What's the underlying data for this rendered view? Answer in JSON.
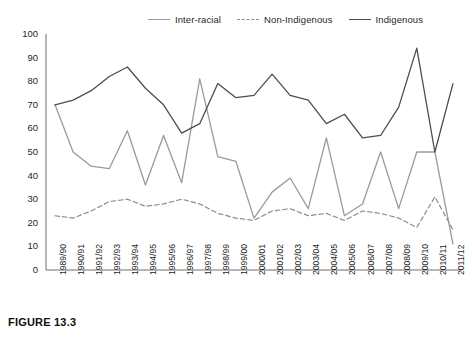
{
  "caption": "FIGURE 13.3",
  "legend": {
    "position": "top",
    "entries": [
      {
        "label": "Inter-racial",
        "color": "#9a9a9a",
        "style": "solid"
      },
      {
        "label": "Non-Indigenous",
        "color": "#8d8d8d",
        "style": "dashed"
      },
      {
        "label": "Indigenous",
        "color": "#4d4d4d",
        "style": "solid"
      }
    ]
  },
  "chart_data": {
    "type": "line",
    "title": "",
    "xlabel": "",
    "ylabel": "",
    "ylim": [
      0,
      100
    ],
    "yticks": [
      0,
      10,
      20,
      30,
      40,
      50,
      60,
      70,
      80,
      90,
      100
    ],
    "grid": false,
    "legend_position": "top",
    "categories": [
      "1989/90",
      "1990/91",
      "1991/92",
      "1992/93",
      "1993/94",
      "1994/95",
      "1995/96",
      "1996/97",
      "1997/98",
      "1998/99",
      "1999/00",
      "2000/01",
      "2001/02",
      "2002/03",
      "2003/04",
      "2004/05",
      "2005/06",
      "2006/07",
      "2007/08",
      "2008/09",
      "2009/10",
      "2010/11",
      "2011/12"
    ],
    "series": [
      {
        "name": "Inter-racial",
        "color": "#9a9a9a",
        "style": "solid",
        "values": [
          70,
          50,
          44,
          43,
          59,
          36,
          57,
          37,
          81,
          48,
          46,
          22,
          33,
          39,
          26,
          56,
          23,
          28,
          50,
          26,
          50,
          50,
          11
        ]
      },
      {
        "name": "Non-Indigenous",
        "color": "#8d8d8d",
        "style": "dashed",
        "values": [
          23,
          22,
          25,
          29,
          30,
          27,
          28,
          30,
          28,
          24,
          22,
          21,
          25,
          26,
          23,
          24,
          21,
          25,
          24,
          22,
          18,
          31,
          17
        ]
      },
      {
        "name": "Indigenous",
        "color": "#4d4d4d",
        "style": "solid",
        "values": [
          70,
          72,
          76,
          82,
          86,
          77,
          70,
          58,
          62,
          79,
          73,
          74,
          83,
          74,
          72,
          62,
          66,
          56,
          57,
          69,
          94,
          50,
          79
        ]
      }
    ]
  }
}
